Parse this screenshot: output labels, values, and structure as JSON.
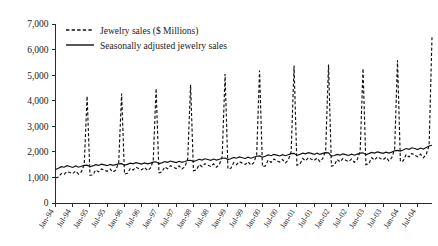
{
  "chart_data": {
    "type": "line",
    "title": "",
    "xlabel": "",
    "ylabel": "",
    "ylim": [
      0,
      7000
    ],
    "ytick_labels": [
      "0",
      "1,000",
      "2,000",
      "3,000",
      "4,000",
      "5,000",
      "6,000",
      "7,000"
    ],
    "ytick_values": [
      0,
      1000,
      2000,
      3000,
      4000,
      5000,
      6000,
      7000
    ],
    "grid": false,
    "legend_position": "top-left",
    "x_tick_labels": [
      "Jan-94",
      "Jul-94",
      "Jan-95",
      "Jul-95",
      "Jan-96",
      "Jul-96",
      "Jan-97",
      "Jul-97",
      "Jan-98",
      "Jul-98",
      "Jan-99",
      "Jul-99",
      "Jan-00",
      "Jul-00",
      "Jan-01",
      "Jul-01",
      "Jan-02",
      "Jul-02",
      "Jan-03",
      "Jul-03",
      "Jan-04",
      "Jul-04"
    ],
    "x_start": "Jan-94",
    "x_end": "Dec-04",
    "series": [
      {
        "name": "Jewelry sales ($ Millions)",
        "style": "dashed",
        "color": "#111111",
        "values": [
          980,
          1020,
          1150,
          1120,
          1230,
          1190,
          1150,
          1250,
          1130,
          1220,
          1500,
          4180,
          1080,
          1100,
          1290,
          1220,
          1330,
          1280,
          1240,
          1330,
          1210,
          1290,
          1580,
          4280,
          1130,
          1160,
          1350,
          1290,
          1400,
          1340,
          1300,
          1390,
          1270,
          1360,
          1650,
          4480,
          1180,
          1210,
          1410,
          1340,
          1460,
          1400,
          1350,
          1450,
          1330,
          1420,
          1720,
          4620,
          1260,
          1290,
          1500,
          1420,
          1540,
          1480,
          1430,
          1530,
          1400,
          1500,
          1810,
          5040,
          1330,
          1360,
          1580,
          1500,
          1620,
          1560,
          1510,
          1610,
          1480,
          1580,
          1900,
          5180,
          1420,
          1450,
          1680,
          1590,
          1720,
          1650,
          1600,
          1700,
          1570,
          1680,
          2010,
          5380,
          1480,
          1510,
          1740,
          1650,
          1780,
          1710,
          1660,
          1760,
          1620,
          1740,
          2060,
          5420,
          1440,
          1470,
          1700,
          1610,
          1740,
          1670,
          1620,
          1720,
          1590,
          1700,
          2020,
          5260,
          1500,
          1530,
          1770,
          1680,
          1810,
          1740,
          1690,
          1790,
          1650,
          1770,
          2100,
          5580,
          1620,
          1650,
          1900,
          1800,
          1940,
          1870,
          1810,
          1910,
          1770,
          1900,
          2260,
          6480
        ]
      },
      {
        "name": "Seasonally adjusted jewelry sales",
        "style": "solid",
        "color": "#111111",
        "values": [
          1310,
          1360,
          1420,
          1400,
          1460,
          1430,
          1390,
          1450,
          1400,
          1440,
          1470,
          1480,
          1420,
          1450,
          1500,
          1470,
          1520,
          1490,
          1460,
          1510,
          1470,
          1500,
          1530,
          1540,
          1480,
          1510,
          1560,
          1530,
          1580,
          1550,
          1520,
          1570,
          1530,
          1560,
          1600,
          1610,
          1540,
          1570,
          1620,
          1590,
          1640,
          1610,
          1580,
          1630,
          1590,
          1620,
          1660,
          1670,
          1620,
          1660,
          1710,
          1680,
          1730,
          1700,
          1670,
          1720,
          1680,
          1710,
          1750,
          1760,
          1700,
          1730,
          1780,
          1750,
          1800,
          1770,
          1740,
          1790,
          1750,
          1790,
          1830,
          1840,
          1790,
          1830,
          1880,
          1850,
          1900,
          1870,
          1840,
          1890,
          1850,
          1890,
          1930,
          1940,
          1860,
          1900,
          1950,
          1920,
          1970,
          1940,
          1900,
          1950,
          1900,
          1940,
          1970,
          1960,
          1830,
          1860,
          1900,
          1870,
          1920,
          1890,
          1860,
          1910,
          1870,
          1910,
          1950,
          1960,
          1890,
          1930,
          1980,
          1950,
          2000,
          1970,
          1940,
          1990,
          1950,
          1990,
          2040,
          2060,
          2030,
          2070,
          2130,
          2100,
          2160,
          2130,
          2090,
          2150,
          2110,
          2170,
          2230,
          2260
        ]
      }
    ]
  },
  "legend": {
    "entries": [
      {
        "label": "Jewelry sales ($ Millions)",
        "style": "dashed"
      },
      {
        "label": "Seasonally adjusted jewelry sales",
        "style": "solid"
      }
    ]
  }
}
